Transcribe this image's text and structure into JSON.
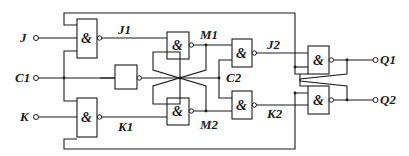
{
  "diagram": {
    "type": "logic-circuit",
    "gate_symbol": "&",
    "inputs": {
      "j": "J",
      "cp": "C1",
      "k": "K"
    },
    "outputs": {
      "q1": "Q1",
      "q2": "Q2"
    },
    "nodes": {
      "j1": "J1",
      "k1": "K1",
      "m1": "M1",
      "m2": "M2",
      "c2": "C2",
      "j2": "J2",
      "k2": "K2"
    },
    "gates": [
      {
        "id": "g-j1",
        "label": "&"
      },
      {
        "id": "g-k1",
        "label": "&"
      },
      {
        "id": "g-m1",
        "label": "&"
      },
      {
        "id": "g-m2",
        "label": "&"
      },
      {
        "id": "g-j2",
        "label": "&"
      },
      {
        "id": "g-k2",
        "label": "&"
      },
      {
        "id": "g-q1",
        "label": "&"
      },
      {
        "id": "g-q2",
        "label": "&"
      }
    ]
  }
}
